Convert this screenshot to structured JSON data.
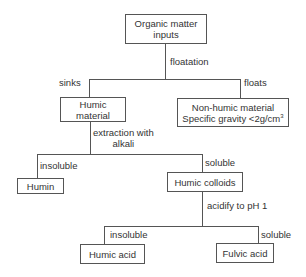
{
  "nodes": {
    "organic_inputs": {
      "line1": "Organic matter",
      "line2": "inputs"
    },
    "humic_material": {
      "line1": "Humic",
      "line2": "material"
    },
    "non_humic": {
      "line1": "Non-humic material",
      "line2_prefix": "Specific gravity <2g/cm",
      "line2_sup": "3"
    },
    "humin": {
      "label": "Humin"
    },
    "humic_colloids": {
      "label": "Humic colloids"
    },
    "humic_acid": {
      "label": "Humic acid"
    },
    "fulvic_acid": {
      "label": "Fulvic acid"
    }
  },
  "edges": {
    "floatation": "floatation",
    "sinks": "sinks",
    "floats": "floats",
    "extraction_line1": "extraction with",
    "extraction_line2": "alkali",
    "insoluble_1": "insoluble",
    "soluble_1": "soluble",
    "acidify": "acidify to pH 1",
    "insoluble_2": "insoluble",
    "soluble_2": "soluble"
  }
}
